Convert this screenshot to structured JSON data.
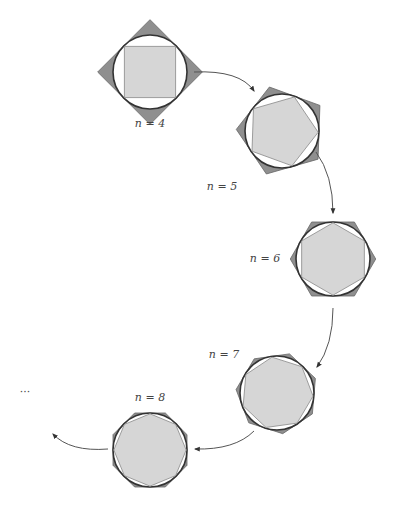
{
  "colors": {
    "outer_fill": "#8f8f8f",
    "inner_fill": "#d6d6d6",
    "circle_stroke": "#333333",
    "arrow": "#555555",
    "background": "#ffffff"
  },
  "stages": [
    {
      "n": 4,
      "label": "n = 4",
      "cx": 150,
      "cy": 72,
      "r": 37,
      "rotation_deg": 45,
      "label_x": 150,
      "label_y": 127
    },
    {
      "n": 5,
      "label": "n = 5",
      "cx": 282,
      "cy": 131,
      "r": 37,
      "rotation_deg": -20,
      "label_x": 222,
      "label_y": 190
    },
    {
      "n": 6,
      "label": "n = 6",
      "cx": 333,
      "cy": 259,
      "r": 37,
      "rotation_deg": 0,
      "label_x": 265,
      "label_y": 262
    },
    {
      "n": 7,
      "label": "n = 7",
      "cx": 277,
      "cy": 393,
      "r": 37,
      "rotation_deg": 8,
      "label_x": 224,
      "label_y": 358
    },
    {
      "n": 8,
      "label": "n = 8",
      "cx": 150,
      "cy": 450,
      "r": 37,
      "rotation_deg": 0,
      "label_x": 150,
      "label_y": 401
    }
  ],
  "arrows": [
    {
      "from": [
        194,
        72
      ],
      "ctrl": [
        240,
        70
      ],
      "to": [
        254,
        91
      ]
    },
    {
      "from": [
        316,
        152
      ],
      "ctrl": [
        333,
        175
      ],
      "to": [
        333,
        213
      ]
    },
    {
      "from": [
        333,
        308
      ],
      "ctrl": [
        333,
        345
      ],
      "to": [
        317,
        367
      ]
    },
    {
      "from": [
        254,
        431
      ],
      "ctrl": [
        235,
        450
      ],
      "to": [
        195,
        449
      ]
    },
    {
      "from": [
        108,
        449
      ],
      "ctrl": [
        70,
        452
      ],
      "to": [
        53,
        434
      ]
    }
  ],
  "ellipsis": {
    "text": "···",
    "x": 25,
    "y": 396
  }
}
